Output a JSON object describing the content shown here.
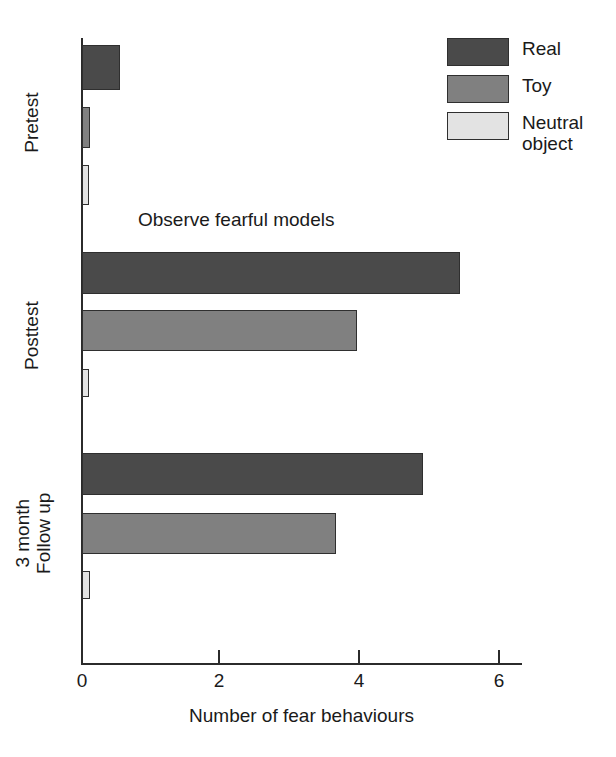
{
  "chart_data": {
    "type": "bar",
    "orientation": "horizontal",
    "title": "",
    "xlabel": "Number of fear behaviours",
    "ylabel": "",
    "xlim": [
      0,
      6.3
    ],
    "xticks": [
      0,
      2,
      4,
      6
    ],
    "xtick_labels": [
      "0",
      "2",
      "4",
      "6"
    ],
    "grid": false,
    "categories": [
      "Pretest",
      "Posttest",
      "3 month\nFollow up"
    ],
    "series": [
      {
        "name": "Real",
        "color": "#4a4a4a",
        "values": [
          0.55,
          5.43,
          4.9
        ]
      },
      {
        "name": "Toy",
        "color": "#808080",
        "values": [
          0.12,
          3.95,
          3.65
        ]
      },
      {
        "name": "Neutral object",
        "color": "#e3e3e3",
        "values": [
          0.1,
          0.1,
          0.12
        ]
      }
    ],
    "annotations": [
      {
        "text": "Observe fearful models",
        "x": 0.8,
        "y_between": "Pretest / Posttest"
      }
    ],
    "legend": {
      "position": "top-right",
      "entries": [
        "Real",
        "Toy",
        "Neutral object"
      ]
    }
  },
  "axes": {
    "x_title": "Number of fear behaviours",
    "ticks": [
      {
        "value": "0",
        "px": 82
      },
      {
        "value": "2",
        "px": 219
      },
      {
        "value": "4",
        "px": 359
      },
      {
        "value": "6",
        "px": 499
      }
    ]
  },
  "groups": [
    {
      "label": "Pretest",
      "bars": [
        {
          "series": "Real",
          "value": 0.55,
          "top": 45,
          "height": 45,
          "color": "#4a4a4a"
        },
        {
          "series": "Toy",
          "value": 0.12,
          "top": 107,
          "height": 41,
          "color": "#808080"
        },
        {
          "series": "Neutral object",
          "value": 0.1,
          "top": 165,
          "height": 40,
          "color": "#e3e3e3"
        }
      ]
    },
    {
      "label": "Posttest",
      "bars": [
        {
          "series": "Real",
          "value": 5.43,
          "top": 252,
          "height": 42,
          "color": "#4a4a4a"
        },
        {
          "series": "Toy",
          "value": 3.95,
          "top": 310,
          "height": 41,
          "color": "#808080"
        },
        {
          "series": "Neutral object",
          "value": 0.1,
          "top": 369,
          "height": 28,
          "color": "#e3e3e3"
        }
      ]
    },
    {
      "label": "3 month\nFollow up",
      "bars": [
        {
          "series": "Real",
          "value": 4.9,
          "top": 453,
          "height": 42,
          "color": "#4a4a4a"
        },
        {
          "series": "Toy",
          "value": 3.65,
          "top": 513,
          "height": 41,
          "color": "#808080"
        },
        {
          "series": "Neutral object",
          "value": 0.12,
          "top": 571,
          "height": 28,
          "color": "#e3e3e3"
        }
      ]
    }
  ],
  "annotation": {
    "text": "Observe fearful models"
  },
  "legend": {
    "items": [
      {
        "label": "Real",
        "color": "#4a4a4a"
      },
      {
        "label": "Toy",
        "color": "#808080"
      },
      {
        "label": "Neutral object",
        "color": "#e3e3e3"
      }
    ]
  }
}
